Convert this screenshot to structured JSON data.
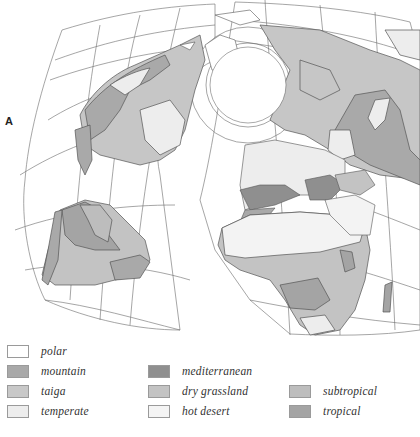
{
  "figure": {
    "panel_label": "A",
    "colors": {
      "polar": "#ffffff",
      "mountain": "#a9a9a9",
      "taiga": "#c6c6c6",
      "temperate": "#ededed",
      "mediterranean": "#8f8f8f",
      "dry_grassland": "#c3c3c3",
      "hot_desert": "#f3f3f3",
      "subtropical": "#bdbdbd",
      "tropical": "#a4a4a4",
      "outline": "#555555",
      "grid": "#6a6a6a"
    }
  },
  "legend": {
    "items": [
      {
        "key": "polar",
        "label": "polar",
        "color": "#ffffff"
      },
      {
        "key": "mountain",
        "label": "mountain",
        "color": "#a9a9a9"
      },
      {
        "key": "taiga",
        "label": "taiga",
        "color": "#c8c8c8"
      },
      {
        "key": "temperate",
        "label": "temperate",
        "color": "#ededed"
      },
      {
        "key": "mediterranean",
        "label": "mediterranean",
        "color": "#8f8f8f"
      },
      {
        "key": "dry_grassland",
        "label": "dry grassland",
        "color": "#c3c3c3"
      },
      {
        "key": "hot_desert",
        "label": "hot desert",
        "color": "#f4f4f4"
      },
      {
        "key": "subtropical",
        "label": "subtropical",
        "color": "#bdbdbd"
      },
      {
        "key": "tropical",
        "label": "tropical",
        "color": "#a4a4a4"
      }
    ]
  }
}
